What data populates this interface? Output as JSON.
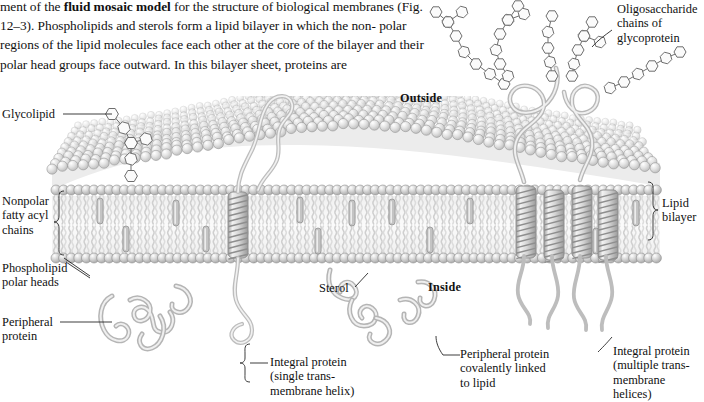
{
  "figure": {
    "kind": "textbook-diagram",
    "palette": {
      "ink": "#1a1a1a",
      "head_fill": "#c9c9c9",
      "head_stroke": "#8f8f8f",
      "head_highlight": "#ffffff",
      "tail": "#d8d8d8",
      "tail_dark": "#b4b4b4",
      "helix_fill": "#d2d2d2",
      "helix_stroke": "#808080",
      "protein_fill": "#cfcfcf",
      "protein_stroke": "#8a8a8a",
      "sugar_stroke": "#6e6e6e",
      "sugar_fill": "#fbfbfb",
      "surface_top": "#e3e3e3",
      "background": "#ffffff"
    }
  },
  "body_text": {
    "line1_pre": "ment of the ",
    "line1_bold": "fluid mosaic model",
    "line1_post": " for the structure of biological membranes",
    "line2": "(Fig. 12–3). Phospholipids and sterols form a lipid bilayer in which the non-",
    "line3": "polar regions of the lipid molecules face each other at the core of the bilayer",
    "line4": "and their polar head groups face outward. In this bilayer sheet, proteins are"
  },
  "labels": {
    "glycolipid": "Glycolipid",
    "nonpolar_chains": "Nonpolar\nfatty acyl\nchains",
    "phospholipid_heads": "Phospholipid\npolar heads",
    "peripheral_protein": "Peripheral\nprotein",
    "outside": "Outside",
    "inside": "Inside",
    "sterol": "Sterol",
    "oligosaccharide": "Oligosaccharide\nchains of\nglycoprotein",
    "lipid_bilayer": "Lipid\nbilayer",
    "integral_single": "Integral protein\n(single trans-\nmembrane helix)",
    "peripheral_linked": "Peripheral protein\ncovalently linked\nto lipid",
    "integral_multiple": "Integral protein\n(multiple trans-\nmembrane helices)"
  }
}
